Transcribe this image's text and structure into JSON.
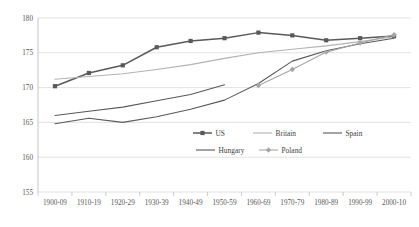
{
  "chart_data": {
    "type": "line",
    "title": "",
    "xlabel": "",
    "ylabel": "",
    "ylim": [
      155,
      180
    ],
    "yticks": [
      155,
      160,
      165,
      170,
      175,
      180
    ],
    "grid": true,
    "legend_position": "bottom-center",
    "categories": [
      "1900-09",
      "1910-19",
      "1920-29",
      "1930-39",
      "1940-49",
      "1950-59",
      "1960-69",
      "1970-79",
      "1980-89",
      "1990-99",
      "2000-10"
    ],
    "series": [
      {
        "name": "US",
        "color": "#595959",
        "marker": "square",
        "values": [
          170.2,
          172.1,
          173.2,
          175.8,
          176.7,
          177.1,
          177.9,
          177.5,
          176.8,
          177.1,
          177.4
        ]
      },
      {
        "name": "Britain",
        "color": "#b3b3b3",
        "marker": "none",
        "values": [
          171.2,
          171.6,
          172.0,
          172.6,
          173.3,
          174.2,
          175.0,
          175.5,
          176.0,
          176.6,
          177.3
        ]
      },
      {
        "name": "Spain",
        "color": "#595959",
        "marker": "none",
        "values": [
          166.0,
          166.6,
          167.2,
          168.1,
          169.0,
          170.4,
          null,
          null,
          null,
          null,
          null
        ]
      },
      {
        "name": "Hungary",
        "color": "#595959",
        "marker": "none",
        "values": [
          164.8,
          165.6,
          165.0,
          165.8,
          166.9,
          168.2,
          170.6,
          173.8,
          175.3,
          176.3,
          177.1
        ]
      },
      {
        "name": "Poland",
        "color": "#a6a6a6",
        "marker": "diamond",
        "values": [
          null,
          null,
          null,
          null,
          null,
          null,
          170.3,
          172.6,
          175.1,
          176.4,
          177.6
        ]
      }
    ],
    "legend": [
      {
        "label": "US",
        "color": "#595959",
        "marker": "square"
      },
      {
        "label": "Britain",
        "color": "#b3b3b3",
        "marker": "none"
      },
      {
        "label": "Spain",
        "color": "#595959",
        "marker": "none"
      },
      {
        "label": "Hungary",
        "color": "#595959",
        "marker": "none"
      },
      {
        "label": "Poland",
        "color": "#a6a6a6",
        "marker": "diamond"
      }
    ]
  },
  "axes": {
    "y_labels": [
      "180",
      "175",
      "170",
      "165",
      "160",
      "155"
    ],
    "x_labels": [
      "1900-09",
      "1910-19",
      "1920-29",
      "1930-39",
      "1940-49",
      "1950-59",
      "1960-69",
      "1970-79",
      "1980-89",
      "1990-99",
      "2000-10"
    ]
  },
  "colors": {
    "grid": "#d9d9d9",
    "axis": "#bfbfbf",
    "text": "#595959",
    "plot_background": "#ffffff"
  }
}
